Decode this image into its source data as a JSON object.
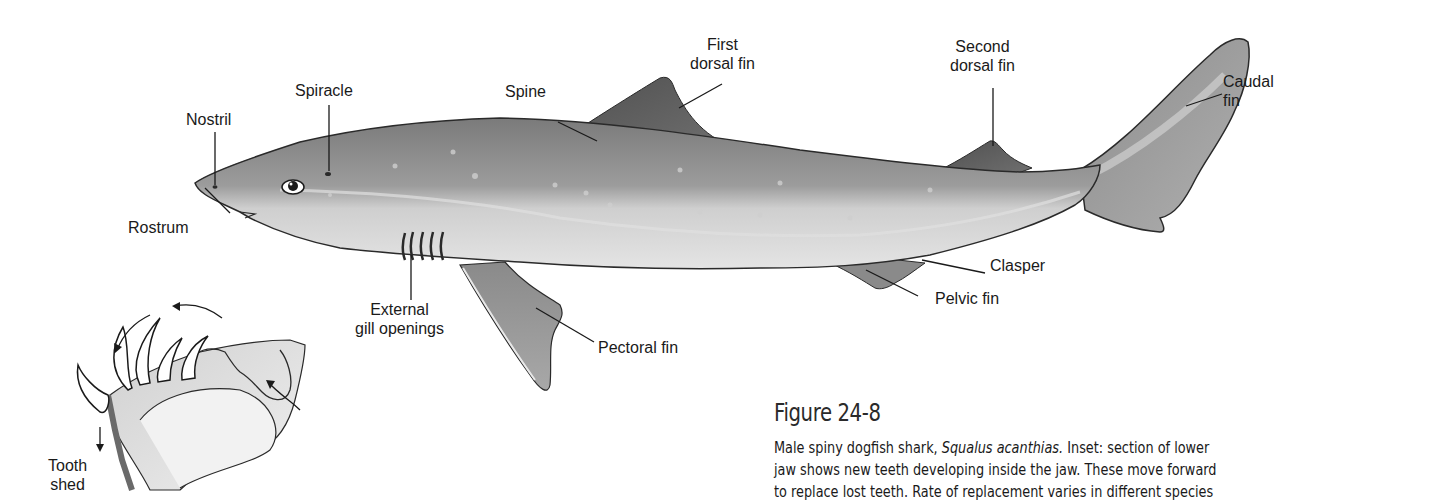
{
  "figure": {
    "title": "Figure 24-8",
    "caption": {
      "prefix": "Male spiny dogfish shark, ",
      "species": "Squalus acanthias.",
      "rest_line1": " Inset: section of lower",
      "line2": "jaw shows new teeth developing inside the jaw. These move forward",
      "line3": "to replace lost teeth. Rate of replacement varies in different species"
    },
    "labels": {
      "nostril": "Nostril",
      "spiracle": "Spiracle",
      "rostrum": "Rostrum",
      "spine": "Spine",
      "first_dorsal_line1": "First",
      "first_dorsal_line2": "dorsal fin",
      "second_dorsal_line1": "Second",
      "second_dorsal_line2": "dorsal fin",
      "caudal_line1": "Caudal",
      "caudal_line2": "fin",
      "clasper": "Clasper",
      "pelvic_fin": "Pelvic fin",
      "gill_line1": "External",
      "gill_line2": "gill openings",
      "pectoral_fin": "Pectoral fin",
      "tooth_line1": "Tooth",
      "tooth_line2": "shed"
    },
    "colors": {
      "body_dark": "#6e6e6e",
      "body_mid": "#9a9a9a",
      "belly": "#d8d8d8",
      "fin": "#5a5a5a",
      "outline": "#2a2a2a"
    }
  }
}
